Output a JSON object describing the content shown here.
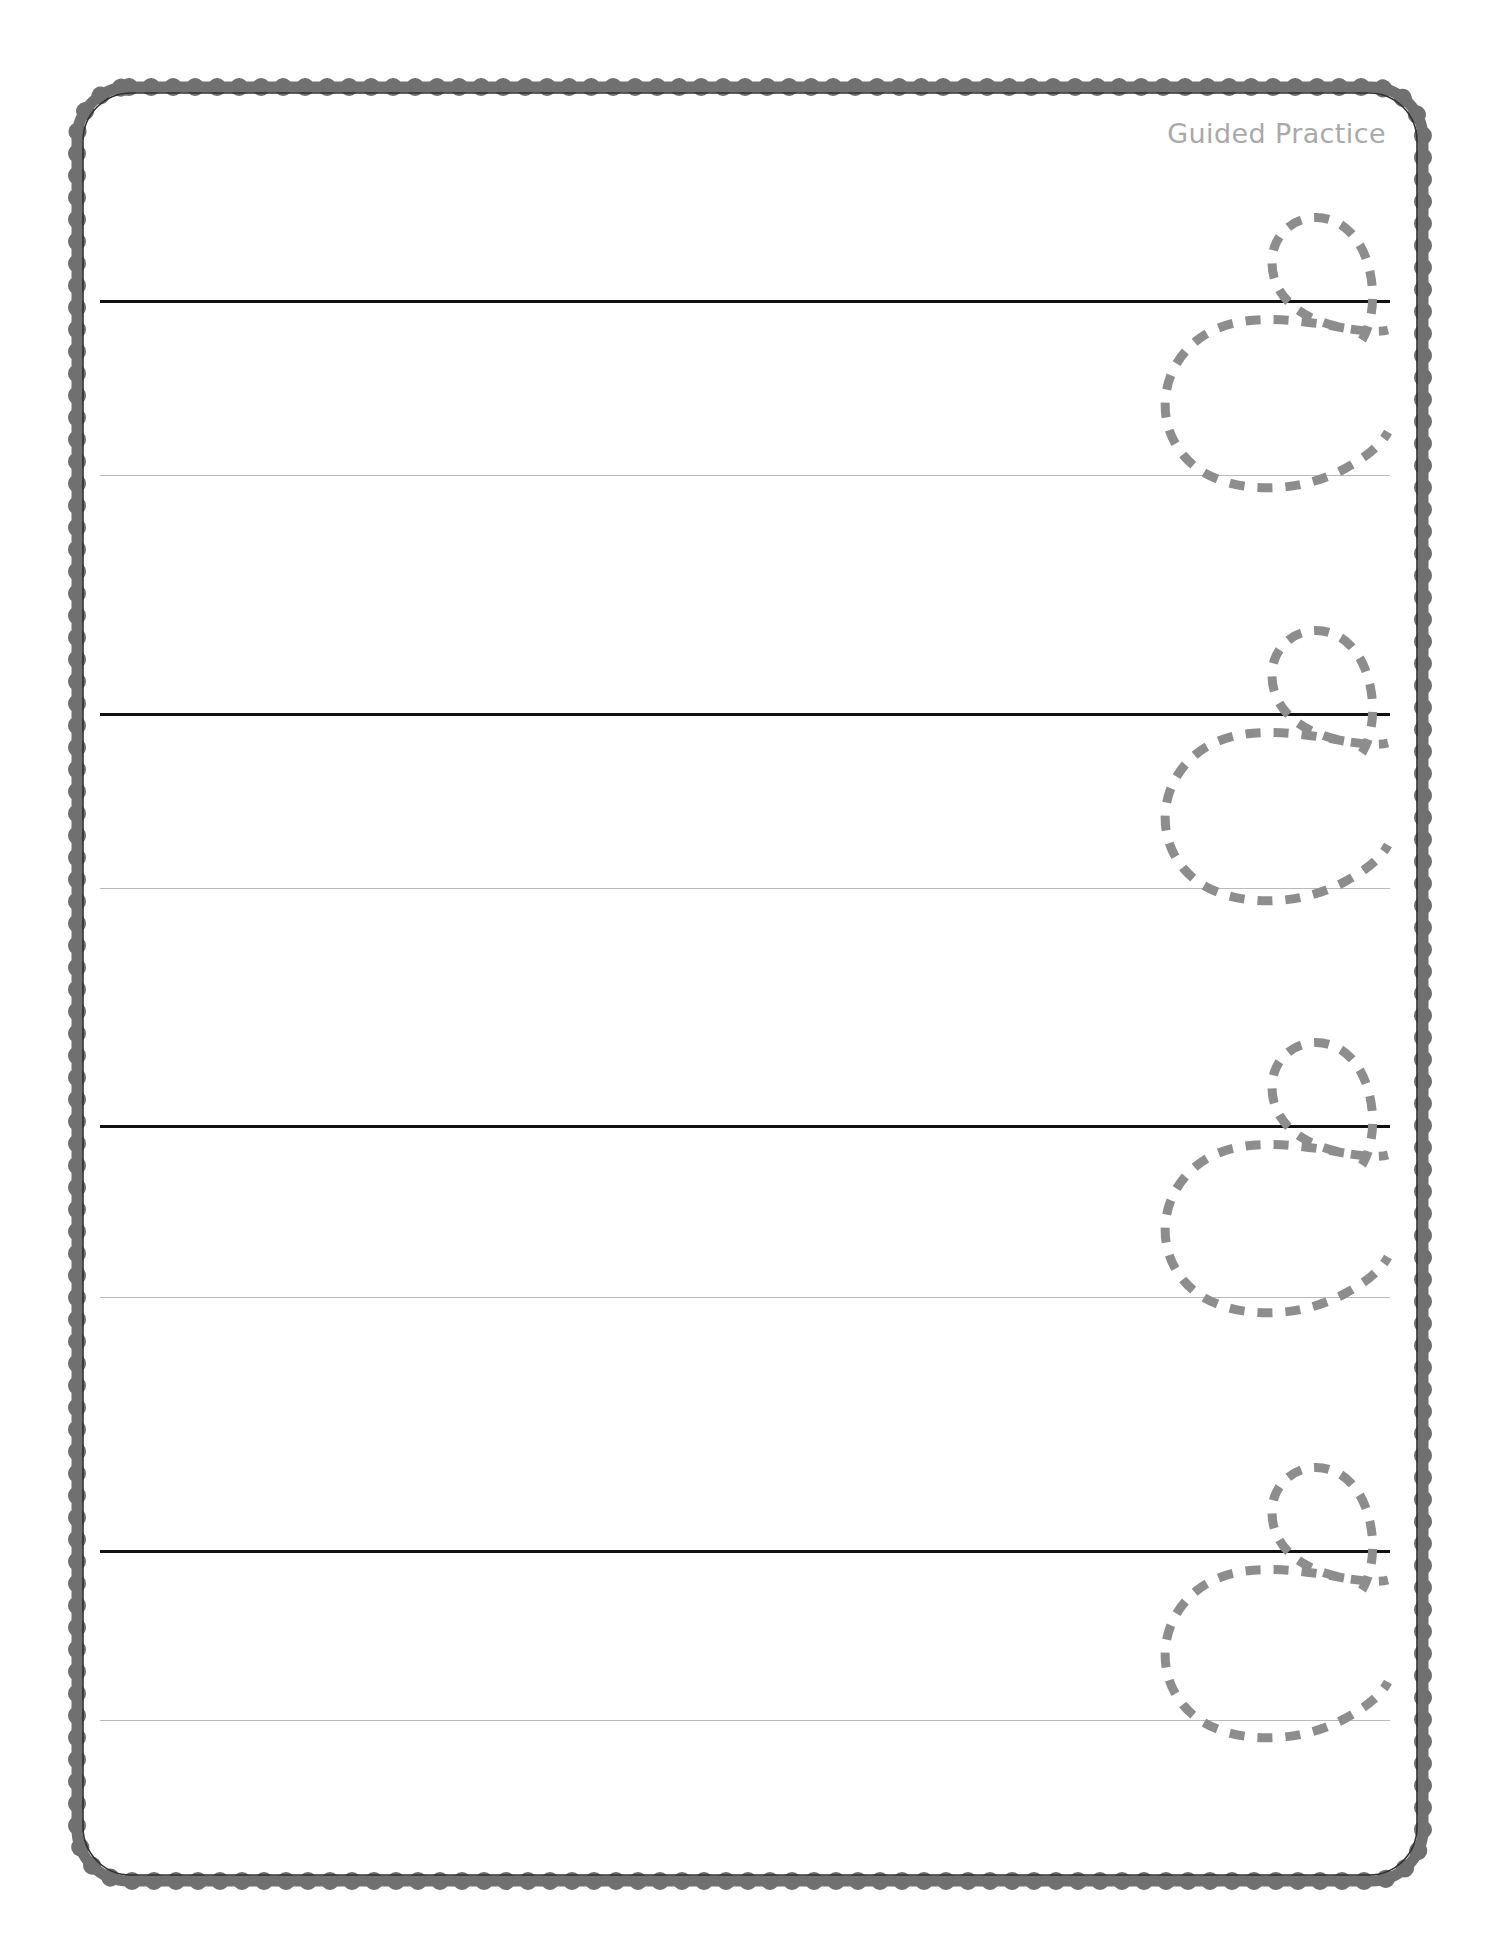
{
  "page": {
    "width": 1498,
    "height": 1948,
    "background_color": "#ffffff",
    "title": "Guided Practice"
  },
  "header": {
    "label": "Guided Practice",
    "color": "#a9a9a9"
  },
  "border": {
    "style": "scalloped-bubble-frame",
    "color": "#707070",
    "inner_line_color": "#3a3a3a",
    "left": 68,
    "top": 78,
    "width": 1364,
    "height": 1812,
    "corner_radius": 56
  },
  "worksheet": {
    "letter": "c",
    "letter_case": "lowercase",
    "script": "cursive",
    "trace_color": "#8d8d8d",
    "midline_color": "#111111",
    "baseline_color": "#b9b9b9",
    "line_left": 100,
    "line_right": 1390,
    "rows": [
      {
        "index": 1,
        "midline_y": 300,
        "baseline_y": 475,
        "letter": "c",
        "letter_x": 1130,
        "letter_top": 180
      },
      {
        "index": 2,
        "midline_y": 713,
        "baseline_y": 888,
        "letter": "c",
        "letter_x": 1130,
        "letter_top": 593
      },
      {
        "index": 3,
        "midline_y": 1125,
        "baseline_y": 1297,
        "letter": "c",
        "letter_x": 1130,
        "letter_top": 1005
      },
      {
        "index": 4,
        "midline_y": 1550,
        "baseline_y": 1720,
        "letter": "c",
        "letter_x": 1130,
        "letter_top": 1430
      }
    ]
  }
}
